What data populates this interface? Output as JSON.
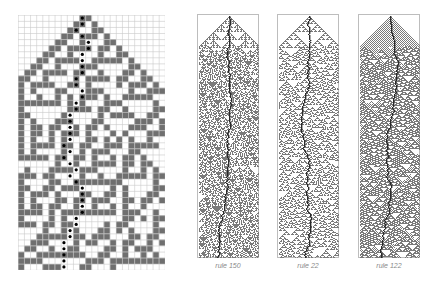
{
  "figure": {
    "left_grid": {
      "cols": 24,
      "rows": 42,
      "cell_px": 6.1,
      "dark_color": "#6f6f6f",
      "line_color": "#c9c9c9",
      "marker": "black-dot",
      "apex_col": 10,
      "rule": 30,
      "seed_note": "single dark cell at top, dots trace boundary path"
    },
    "panels": [
      {
        "caption": "rule 150",
        "rule": 150,
        "left": 197
      },
      {
        "caption": "rule 22",
        "rule": 22,
        "left": 277
      },
      {
        "caption": "rule 122",
        "rule": 122,
        "left": 358
      }
    ],
    "colors": {
      "cell": "#7a7a7a",
      "path": "#2a2a2a",
      "frame": "#bdbdbd",
      "caption": "#8a8a8a"
    }
  }
}
